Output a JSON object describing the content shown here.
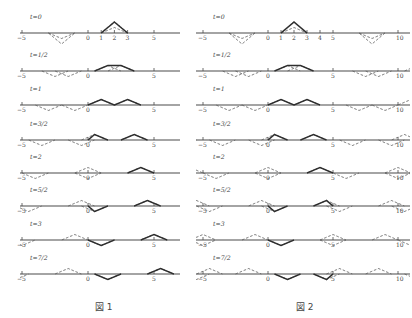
{
  "chart_data": [
    {
      "type": "line",
      "title": "図 1",
      "description": "d'Alembert solution on half-line x>=0, odd reflection at x=0; initial triangle on [1,3], peak at x=2",
      "initial_profile": {
        "points": [
          [
            1,
            0
          ],
          [
            2,
            2
          ],
          [
            3,
            0
          ]
        ]
      },
      "extension": "odd-about-0",
      "domain": [
        0,
        null
      ],
      "axis_ticks": [
        -5,
        0,
        5
      ],
      "frames": [
        {
          "t_label": "t=0",
          "t": 0
        },
        {
          "t_label": "t=1/2",
          "t": 0.5
        },
        {
          "t_label": "t=1",
          "t": 1
        },
        {
          "t_label": "t=3/2",
          "t": 1.5
        },
        {
          "t_label": "t=2",
          "t": 2
        },
        {
          "t_label": "t=5/2",
          "t": 2.5
        },
        {
          "t_label": "t=3",
          "t": 3
        },
        {
          "t_label": "t=7/2",
          "t": 3.5
        }
      ],
      "legend": {
        "solid": "u(x,t)",
        "dashed": "traveling halves ½F(x−t), ½F(x+t)"
      }
    },
    {
      "type": "line",
      "title": "図 2",
      "description": "d'Alembert solution on interval 0<=x<=5, odd reflections at x=0 and x=5; initial triangle on [1,3], peak at x=2",
      "initial_profile": {
        "points": [
          [
            1,
            0
          ],
          [
            2,
            2
          ],
          [
            3,
            0
          ]
        ]
      },
      "extension": "odd-about-0-and-5",
      "domain": [
        0,
        5
      ],
      "axis_ticks": [
        -5,
        0,
        1,
        2,
        3,
        4,
        5,
        10
      ],
      "frames": [
        {
          "t_label": "t=0",
          "t": 0
        },
        {
          "t_label": "t=1/2",
          "t": 0.5
        },
        {
          "t_label": "t=1",
          "t": 1
        },
        {
          "t_label": "t=3/2",
          "t": 1.5
        },
        {
          "t_label": "t=2",
          "t": 2
        },
        {
          "t_label": "t=5/2",
          "t": 2.5
        },
        {
          "t_label": "t=3",
          "t": 3
        },
        {
          "t_label": "t=7/2",
          "t": 3.5
        }
      ],
      "legend": {
        "solid": "u(x,t)",
        "dashed": "traveling halves ½F(x−t), ½F(x+t)"
      }
    }
  ],
  "figures": [
    {
      "caption": "図 1",
      "x_range": [
        -6.5,
        7
      ],
      "origin_px": 88,
      "unit_px": 13.2,
      "line_px": [
        20,
        180
      ],
      "tick_labels": {
        "t0": [
          "−5",
          "0",
          "1",
          "2",
          "3",
          "5"
        ],
        "other": [
          "−5",
          "0",
          "5"
        ]
      },
      "tick_values": {
        "t0": [
          -5,
          0,
          1,
          2,
          3,
          5
        ],
        "other": [
          -5,
          0,
          5
        ]
      }
    },
    {
      "caption": "図 2",
      "x_range": [
        -5.5,
        10.8
      ],
      "origin_px": 268,
      "unit_px": 13.0,
      "line_px": [
        196,
        410
      ],
      "tick_labels": {
        "t0": [
          "−5",
          "0",
          "1",
          "2",
          "3",
          "4",
          "5",
          "10"
        ],
        "other": [
          "−5",
          "0",
          "5",
          "10"
        ]
      },
      "tick_values": {
        "t0": [
          -5,
          0,
          1,
          2,
          3,
          4,
          5,
          10
        ],
        "other": [
          -5,
          0,
          5,
          10
        ]
      }
    }
  ],
  "row_axis_y": [
    33,
    71,
    105,
    140,
    173,
    206,
    240,
    274
  ],
  "unit_height_px": 11
}
